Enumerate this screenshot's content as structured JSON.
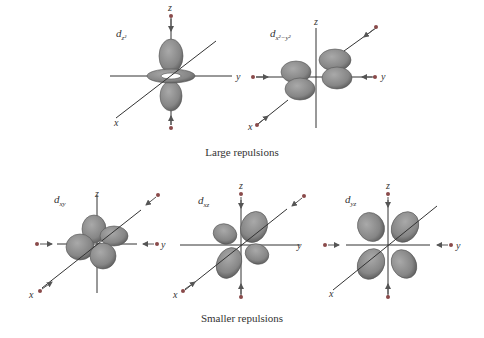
{
  "figure": {
    "captions": {
      "large": "Large repulsions",
      "smaller": "Smaller repulsions"
    },
    "orbitals": [
      {
        "id": "dz2",
        "name": "d",
        "sub": "z²",
        "group": "large"
      },
      {
        "id": "dx2y2",
        "name": "d",
        "sub": "x²−y²",
        "group": "large"
      },
      {
        "id": "dxy",
        "name": "d",
        "sub": "xy",
        "group": "smaller"
      },
      {
        "id": "dxz",
        "name": "d",
        "sub": "xz",
        "group": "smaller"
      },
      {
        "id": "dyz",
        "name": "d",
        "sub": "yz",
        "group": "smaller"
      }
    ],
    "axis_labels": {
      "x": "x",
      "y": "y",
      "z": "z"
    },
    "colors": {
      "lobe": "#8a8a8a",
      "lobe_dark": "#5c5c5c",
      "axis": "#333333",
      "ligand": "#8a4a4a"
    }
  }
}
